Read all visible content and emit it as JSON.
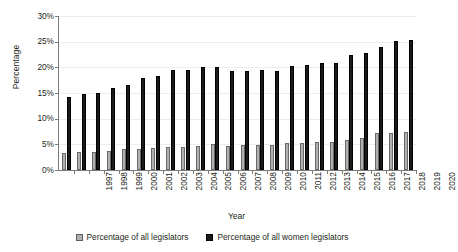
{
  "chart_data": {
    "type": "bar",
    "title": "",
    "xlabel": "Year",
    "ylabel": "Percentage",
    "ylim": [
      0,
      30
    ],
    "ytick_labels": [
      "0%",
      "5%",
      "10%",
      "15%",
      "20%",
      "25%",
      "30%"
    ],
    "ytick_values": [
      0,
      5,
      10,
      15,
      20,
      25,
      30
    ],
    "grid": true,
    "legend_position": "bottom",
    "categories": [
      "1997",
      "1998",
      "1999",
      "2000",
      "2001",
      "2002",
      "2003",
      "2004",
      "2005",
      "2006",
      "2007",
      "2008",
      "2009",
      "2010",
      "2011",
      "2012",
      "2013",
      "2014",
      "2015",
      "2016",
      "2017",
      "2018",
      "2019",
      "2020"
    ],
    "series": [
      {
        "name": "Percentage of all legislators",
        "color": "#b0b0b0",
        "values": [
          3.3,
          3.5,
          3.5,
          3.8,
          4.0,
          4.0,
          4.2,
          4.5,
          4.5,
          4.7,
          5.0,
          4.7,
          4.8,
          4.8,
          4.8,
          5.2,
          5.3,
          5.4,
          5.4,
          5.9,
          6.2,
          7.2,
          7.3,
          7.4
        ]
      },
      {
        "name": "Percentage of all women legislators",
        "color": "#1a1a1a",
        "values": [
          14.3,
          14.8,
          15.0,
          15.9,
          16.5,
          18.0,
          18.3,
          19.5,
          19.5,
          20.0,
          20.0,
          19.3,
          19.3,
          19.4,
          19.3,
          20.2,
          20.4,
          20.8,
          20.8,
          22.4,
          22.7,
          24.0,
          25.2,
          25.3
        ]
      }
    ]
  },
  "legend": {
    "items": [
      {
        "label": "Percentage of all legislators",
        "swatch": "light-square-icon"
      },
      {
        "label": "Percentage of all women legislators",
        "swatch": "dark-square-icon"
      }
    ]
  }
}
